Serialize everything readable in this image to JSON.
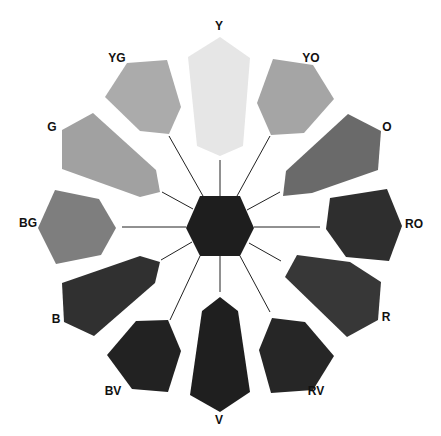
{
  "diagram": {
    "title": "",
    "center": {
      "name": "center-hexagon",
      "color": "#1e1e1e",
      "points": "200,196 240,196 254,228 240,256 200,256 186,228"
    },
    "segments": [
      {
        "label": "Y",
        "color": "#e6e6e6",
        "points": "220,37 250,58 243,146 220,156 197,146 188,57",
        "label_x": 219,
        "label_y": 30,
        "spoke": [
          220,
          160,
          220,
          196
        ]
      },
      {
        "label": "YO",
        "color": "#a5a5a5",
        "points": "273,59 313,65 334,99 304,133 271,135 257,103",
        "label_x": 311,
        "label_y": 62,
        "spoke": [
          270,
          136,
          237,
          196
        ]
      },
      {
        "label": "O",
        "color": "#6a6a6a",
        "points": "348,114 381,131 378,170 312,193 283,196 286,171",
        "label_x": 387,
        "label_y": 131,
        "spoke": [
          280,
          192,
          247,
          210
        ]
      },
      {
        "label": "RO",
        "color": "#2e2e2e",
        "points": "330,198 387,189 402,226 389,261 346,257 326,229",
        "label_x": 414,
        "label_y": 228,
        "spoke": [
          320,
          227,
          254,
          227
        ]
      },
      {
        "label": "R",
        "color": "#373737",
        "points": "297,255 350,262 381,282 378,320 347,337 285,277",
        "label_x": 386,
        "label_y": 321,
        "spoke": [
          281,
          261,
          249,
          243
        ]
      },
      {
        "label": "RV",
        "color": "#262626",
        "points": "272,318 305,322 334,356 313,390 271,393 259,350",
        "label_x": 316,
        "label_y": 395,
        "spoke": [
          270,
          312,
          240,
          256
        ]
      },
      {
        "label": "V",
        "color": "#1f1f1f",
        "points": "220,297 238,311 250,392 220,412 190,395 202,311",
        "label_x": 219,
        "label_y": 424,
        "spoke": [
          220,
          256,
          220,
          292
        ]
      },
      {
        "label": "BV",
        "color": "#222222",
        "points": "136,321 168,320 181,351 168,392 132,389 107,355",
        "label_x": 113,
        "label_y": 395,
        "spoke": [
          170,
          320,
          200,
          256
        ]
      },
      {
        "label": "B",
        "color": "#303030",
        "points": "140,256 160,262 155,283 94,336 64,322 62,283",
        "label_x": 56,
        "label_y": 323,
        "spoke": [
          161,
          260,
          192,
          242
        ]
      },
      {
        "label": "BG",
        "color": "#7e7e7e",
        "points": "55,190 99,199 116,228 101,255 56,264 38,228",
        "label_x": 28,
        "label_y": 227,
        "spoke": [
          122,
          227,
          186,
          227
        ]
      },
      {
        "label": "G",
        "color": "#a1a1a1",
        "points": "93,113 62,130 62,169 140,197 160,192 156,170",
        "label_x": 52,
        "label_y": 131,
        "spoke": [
          162,
          192,
          193,
          209
        ]
      },
      {
        "label": "YG",
        "color": "#ababab",
        "points": "127,63 167,60 181,107 169,134 140,131 105,97",
        "label_x": 117,
        "label_y": 62,
        "spoke": [
          169,
          136,
          203,
          196
        ]
      }
    ]
  }
}
